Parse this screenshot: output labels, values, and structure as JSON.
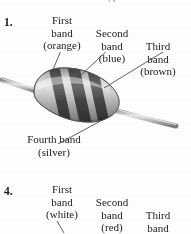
{
  "page": {
    "instruction": "For each resistor shown, find the res",
    "background_color": "#fefefe",
    "text_color": "#1a1a1a"
  },
  "items": [
    {
      "number": "1.",
      "labels": {
        "first_band": "First\nband\n(orange)",
        "first_band_line1": "First",
        "first_band_line2": "band",
        "first_band_line3": "(orange)",
        "second_band_line1": "Second",
        "second_band_line2": "band",
        "second_band_line3": "(blue)",
        "third_band_line1": "Third",
        "third_band_line2": "band",
        "third_band_line3": "(brown)",
        "fourth_band_line1": "Fourth band",
        "fourth_band_line2": "(silver)"
      },
      "figure": {
        "type": "resistor-photograph",
        "band_colors_named": [
          "orange",
          "blue",
          "brown",
          "silver"
        ],
        "rendered_as": "grayscale scan",
        "body_fill": "#b9b9b9",
        "band_fill": "#3a3a3a",
        "lead_fill": "#c9c9c9"
      }
    },
    {
      "number": "4.",
      "labels": {
        "first_band_line1": "First",
        "first_band_line2": "band",
        "first_band_line3": "(white)",
        "second_band_line1": "Second",
        "second_band_line2": "band",
        "second_band_line3": "(red)",
        "third_band_line1": "Third",
        "third_band_line2": "band"
      }
    }
  ]
}
